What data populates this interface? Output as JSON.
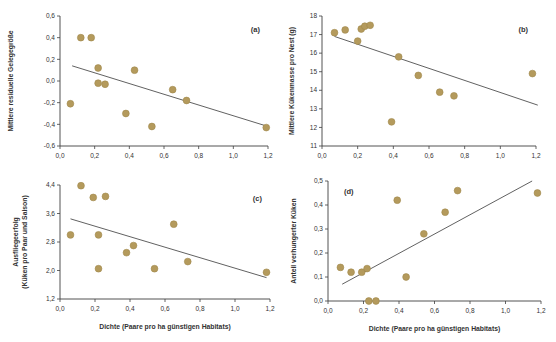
{
  "figure": {
    "background": "#ffffff",
    "point_color": "#b49a5c",
    "point_stroke": "#a0884c",
    "trend_color": "#4f4f4f",
    "axis_color": "#3f3f3f",
    "text_color": "#333333",
    "xlabel": "Dichte (Paare pro ha günstigen Habitats)",
    "xtick_labels": [
      "0,0",
      "0,2",
      "0,4",
      "0,6",
      "0,8",
      "1,0",
      "1,2"
    ]
  },
  "chart_data": [
    {
      "id": "a",
      "type": "scatter",
      "panel_label": "(a)",
      "label_corner": "tr",
      "ylabel": [
        "Mittlere residuelle Gelegegröße"
      ],
      "ylabel_x": [
        13
      ],
      "xlabel": "",
      "xlim": [
        0,
        1.2
      ],
      "ylim": [
        -0.6,
        0.6
      ],
      "xticks": [
        0,
        0.2,
        0.4,
        0.6,
        0.8,
        1.0,
        1.2
      ],
      "yticks": [
        0.6,
        0.4,
        0.2,
        0.0,
        -0.2,
        -0.4,
        -0.6
      ],
      "ytick_labels": [
        "0,6",
        "0,4",
        "0,2",
        "0,0",
        "-0,2",
        "-0,4",
        "-0,6"
      ],
      "points": [
        [
          0.06,
          -0.21
        ],
        [
          0.12,
          0.4
        ],
        [
          0.18,
          0.4
        ],
        [
          0.22,
          0.12
        ],
        [
          0.22,
          -0.02
        ],
        [
          0.26,
          -0.03
        ],
        [
          0.38,
          -0.3
        ],
        [
          0.43,
          0.1
        ],
        [
          0.53,
          -0.42
        ],
        [
          0.65,
          -0.08
        ],
        [
          0.73,
          -0.18
        ],
        [
          1.19,
          -0.43
        ]
      ],
      "trend": {
        "x1": 0.07,
        "y1": 0.14,
        "x2": 1.18,
        "y2": -0.41
      },
      "margin": {
        "l": 60,
        "r": 10,
        "t": 16,
        "b": 25
      }
    },
    {
      "id": "b",
      "type": "scatter",
      "panel_label": "(b)",
      "label_corner": "tr",
      "ylabel": [
        "Mittlere Kükenmasse pro Nest (g)"
      ],
      "ylabel_x": [
        16
      ],
      "xlabel": "",
      "xlim": [
        0,
        1.2
      ],
      "ylim": [
        11,
        18
      ],
      "xticks": [
        0,
        0.2,
        0.4,
        0.6,
        0.8,
        1.0,
        1.2
      ],
      "yticks": [
        18,
        17,
        16,
        15,
        14,
        13,
        12,
        11
      ],
      "ytick_labels": [
        "18",
        "17",
        "16",
        "15",
        "14",
        "13",
        "12",
        "11"
      ],
      "points": [
        [
          0.07,
          17.1
        ],
        [
          0.13,
          17.25
        ],
        [
          0.2,
          16.65
        ],
        [
          0.22,
          17.3
        ],
        [
          0.24,
          17.45
        ],
        [
          0.27,
          17.5
        ],
        [
          0.39,
          12.3
        ],
        [
          0.43,
          15.8
        ],
        [
          0.54,
          14.8
        ],
        [
          0.66,
          13.9
        ],
        [
          0.74,
          13.7
        ],
        [
          1.18,
          14.9
        ]
      ],
      "trend": {
        "x1": 0.07,
        "y1": 16.9,
        "x2": 1.21,
        "y2": 13.2
      },
      "margin": {
        "l": 44,
        "r": 20,
        "t": 16,
        "b": 25
      }
    },
    {
      "id": "c",
      "type": "scatter",
      "panel_label": "(c)",
      "label_corner": "tr",
      "ylabel": [
        "Ausfliegeerfolg",
        "(Küken pro Paar und Saison)"
      ],
      "ylabel_x": [
        18,
        27
      ],
      "xlabel": "Dichte (Paare pro ha günstigen Habitats)",
      "xlim": [
        0,
        1.2
      ],
      "ylim": [
        1.2,
        4.4
      ],
      "xticks": [
        0,
        0.2,
        0.4,
        0.6,
        0.8,
        1.0,
        1.2
      ],
      "yticks": [
        4.4,
        3.6,
        2.8,
        2.0,
        1.2
      ],
      "ytick_labels": [
        "4,4",
        "3,6",
        "2,8",
        "2,0",
        "1,2"
      ],
      "points": [
        [
          0.06,
          3.0
        ],
        [
          0.12,
          4.38
        ],
        [
          0.19,
          4.05
        ],
        [
          0.22,
          3.0
        ],
        [
          0.22,
          2.05
        ],
        [
          0.26,
          4.08
        ],
        [
          0.38,
          2.5
        ],
        [
          0.42,
          2.7
        ],
        [
          0.54,
          2.05
        ],
        [
          0.65,
          3.3
        ],
        [
          0.73,
          2.25
        ],
        [
          1.18,
          1.95
        ]
      ],
      "trend": {
        "x1": 0.06,
        "y1": 3.45,
        "x2": 1.18,
        "y2": 1.8
      },
      "margin": {
        "l": 60,
        "r": 8,
        "t": 14,
        "b": 43
      }
    },
    {
      "id": "d",
      "type": "scatter",
      "panel_label": "(d)",
      "label_corner": "tl",
      "ylabel": [
        "Anteil verhungerter Küken"
      ],
      "ylabel_x": [
        18
      ],
      "xlabel": "Dichte (Paare pro ha günstigen Habitats)",
      "xlim": [
        0,
        1.2
      ],
      "ylim": [
        0,
        0.5
      ],
      "xticks": [
        0,
        0.2,
        0.4,
        0.6,
        0.8,
        1.0,
        1.2
      ],
      "yticks": [
        0.5,
        0.4,
        0.3,
        0.2,
        0.1,
        0.0
      ],
      "ytick_labels": [
        "0,5",
        "0,4",
        "0,3",
        "0,2",
        "0,1",
        "0,0"
      ],
      "points": [
        [
          0.07,
          0.14
        ],
        [
          0.13,
          0.12
        ],
        [
          0.19,
          0.12
        ],
        [
          0.22,
          0.135
        ],
        [
          0.23,
          0.0
        ],
        [
          0.27,
          0.0
        ],
        [
          0.39,
          0.42
        ],
        [
          0.44,
          0.1
        ],
        [
          0.54,
          0.28
        ],
        [
          0.66,
          0.37
        ],
        [
          0.73,
          0.46
        ],
        [
          1.18,
          0.45
        ]
      ],
      "trend": {
        "x1": 0.08,
        "y1": 0.07,
        "x2": 1.15,
        "y2": 0.5
      },
      "margin": {
        "l": 50,
        "r": 15,
        "t": 10,
        "b": 41
      }
    }
  ]
}
